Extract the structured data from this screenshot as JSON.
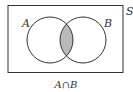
{
  "diagram": {
    "type": "venn",
    "universe_label": "S",
    "sets": [
      {
        "label": "A",
        "cx": 50,
        "cy": 40,
        "r": 23
      },
      {
        "label": "B",
        "cx": 83,
        "cy": 40,
        "r": 23
      }
    ],
    "shaded_region": "A∩B",
    "caption": "A∩B",
    "colors": {
      "stroke": "#333333",
      "shade": "#b9b9b9",
      "background": "#ffffff"
    }
  }
}
